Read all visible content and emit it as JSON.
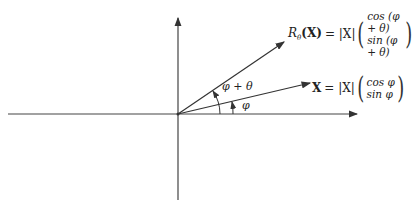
{
  "diagram": {
    "type": "vector-rotation",
    "axes": {
      "horizontal": true,
      "vertical": true
    },
    "vectors": [
      {
        "name": "X",
        "lhs": "X",
        "eq": "= |X|",
        "components": [
          "cos φ",
          "sin φ"
        ],
        "angle_label": "φ"
      },
      {
        "name": "R_theta(X)",
        "lhs_main": "R",
        "lhs_sub": "θ",
        "lhs_arg": "(X)",
        "eq": "= |X|",
        "components": [
          "cos (φ + θ)",
          "sin (φ + θ)"
        ],
        "angle_label": "φ + θ"
      }
    ],
    "colors": {
      "line": "#333333",
      "text": "#222222",
      "background": "#ffffff"
    }
  }
}
